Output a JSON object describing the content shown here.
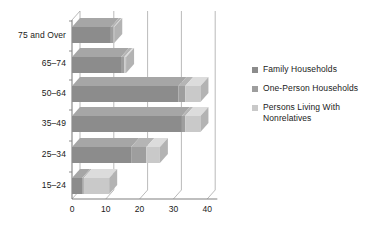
{
  "chart_data": {
    "type": "bar",
    "orientation": "horizontal",
    "stacked": true,
    "style": "3d",
    "title": "",
    "subtitle": "",
    "xlabel": "",
    "ylabel": "",
    "xlim": [
      0,
      43
    ],
    "ylim": null,
    "grid": true,
    "gridlines": "vertical",
    "legend_position": "right",
    "categories": [
      "75 and Over",
      "65–74",
      "50–64",
      "35–49",
      "25–34",
      "15–24"
    ],
    "xticks": [
      0,
      10,
      20,
      30,
      40
    ],
    "xtick_labels": [
      "0",
      "10",
      "20",
      "30",
      "40"
    ],
    "series": [
      {
        "name": "Family Households",
        "color": "#8c8c8c",
        "values": [
          11.5,
          14.5,
          31.5,
          32.5,
          17.5,
          3.0
        ]
      },
      {
        "name": "One-Person Households",
        "color": "#9e9e9e",
        "values": [
          0.8,
          1.0,
          2.0,
          1.0,
          4.5,
          0.5
        ]
      },
      {
        "name": "Persons Living With Nonrelatives",
        "color": "#c9c9c9",
        "values": [
          0.2,
          0.5,
          4.5,
          4.5,
          4.0,
          7.5
        ]
      }
    ],
    "totals": [
      12.5,
      16.0,
      38.0,
      38.0,
      26.0,
      11.0
    ]
  },
  "legend": {
    "items": [
      {
        "label": "Family Households",
        "swatch": "#8c8c8c"
      },
      {
        "label": "One-Person Households",
        "swatch": "#9e9e9e"
      },
      {
        "label": "Persons Living With Nonrelatives",
        "swatch": "#c9c9c9"
      }
    ]
  },
  "colors": {
    "axis": "#808080",
    "gridline": "#a8a8a8",
    "text": "#1a1a1a",
    "background": "#ffffff",
    "series_1": "#8c8c8c",
    "series_1_top": "#a6a6a6",
    "series_1_side": "#787878",
    "series_2": "#9e9e9e",
    "series_2_top": "#b5b5b5",
    "series_2_side": "#8a8a8a",
    "series_3": "#c9c9c9",
    "series_3_top": "#dcdcdc",
    "series_3_side": "#b3b3b3"
  }
}
